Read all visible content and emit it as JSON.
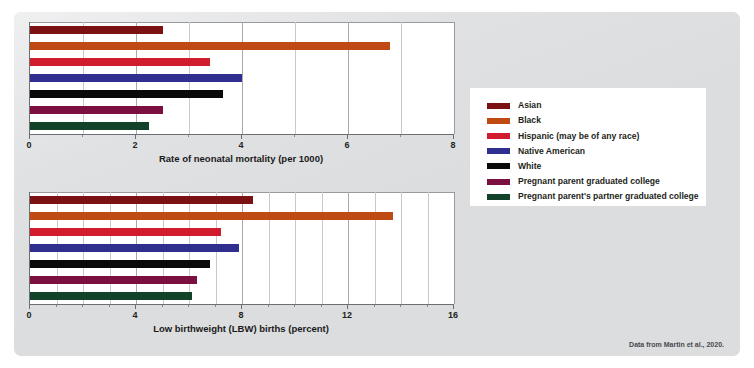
{
  "figure": {
    "credit": "Data from Martin et al., 2020.",
    "background_color": "#dcdddf",
    "plot_background_color": "#ffffff"
  },
  "legend": {
    "position": "right-middle",
    "entries": [
      {
        "label": "Asian",
        "color": "#7b1113"
      },
      {
        "label": "Black",
        "color": "#c04a13"
      },
      {
        "label": "Hispanic (may be of any race)",
        "color": "#d01c2c"
      },
      {
        "label": "Native American",
        "color": "#2f2f8f"
      },
      {
        "label": "White",
        "color": "#0a0a0a"
      },
      {
        "label": "Pregnant parent graduated college",
        "color": "#7b1040"
      },
      {
        "label": "Pregnant parent's partner graduated college",
        "color": "#12432a"
      }
    ]
  },
  "chart_data": [
    {
      "id": "neonatal-mortality",
      "type": "bar",
      "orientation": "horizontal",
      "title": "",
      "xlabel": "Rate of neonatal mortality (per 1000)",
      "ylabel": "",
      "xlim": [
        0,
        8
      ],
      "xticks": [
        0,
        2,
        4,
        6,
        8
      ],
      "xtick_labels": [
        "0",
        "2",
        "4",
        "6",
        "8"
      ],
      "minor_tick_step": 1,
      "grid": true,
      "grid_axis": "x",
      "categories": [
        "Asian",
        "Black",
        "Hispanic (may be of any race)",
        "Native American",
        "White",
        "Pregnant parent graduated college",
        "Pregnant parent's partner graduated college"
      ],
      "values": [
        2.5,
        6.8,
        3.4,
        4.0,
        3.65,
        2.5,
        2.25
      ],
      "colors": [
        "#7b1113",
        "#c04a13",
        "#d01c2c",
        "#2f2f8f",
        "#0a0a0a",
        "#7b1040",
        "#12432a"
      ]
    },
    {
      "id": "low-birthweight",
      "type": "bar",
      "orientation": "horizontal",
      "title": "",
      "xlabel": "Low birthweight (LBW) births (percent)",
      "ylabel": "",
      "xlim": [
        0,
        16
      ],
      "xticks": [
        0,
        4,
        8,
        12,
        16
      ],
      "xtick_labels": [
        "0",
        "4",
        "8",
        "12",
        "16"
      ],
      "minor_tick_step": 1,
      "grid": true,
      "grid_axis": "x",
      "categories": [
        "Asian",
        "Black",
        "Hispanic (may be of any race)",
        "Native American",
        "White",
        "Pregnant parent graduated college",
        "Pregnant parent's partner graduated college"
      ],
      "values": [
        8.4,
        13.7,
        7.2,
        7.9,
        6.8,
        6.3,
        6.1
      ],
      "colors": [
        "#7b1113",
        "#c04a13",
        "#d01c2c",
        "#2f2f8f",
        "#0a0a0a",
        "#7b1040",
        "#12432a"
      ]
    }
  ]
}
